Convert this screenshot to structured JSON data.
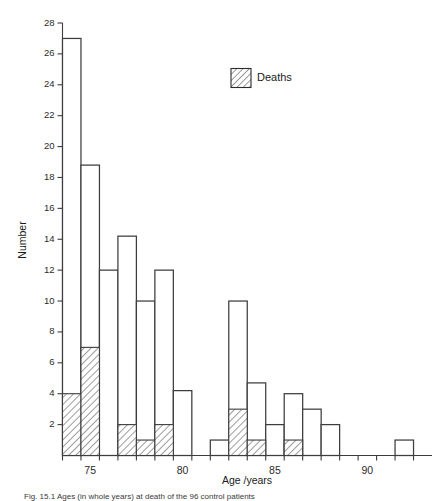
{
  "figure": {
    "caption": "Fig. 15.1  Ages (in whole years) at death of the 96 control patients",
    "legend": {
      "label": "Deaths",
      "swatch_name": "hatched-swatch"
    }
  },
  "chart_data": {
    "type": "bar",
    "title": "",
    "xlabel": "Age /years",
    "ylabel": "Number",
    "xlim": [
      73.5,
      93.5
    ],
    "ylim": [
      0,
      28
    ],
    "ytick_values": [
      2,
      4,
      6,
      8,
      10,
      12,
      14,
      16,
      18,
      20,
      22,
      24,
      26,
      28
    ],
    "xtick_values": [
      75,
      80,
      85,
      90
    ],
    "xtick_labels": [
      "75",
      "80",
      "85",
      "90"
    ],
    "bin_width": 1,
    "grid": false,
    "legend_position": "top-right",
    "series": [
      {
        "name": "Total",
        "style": "outline",
        "x": [
          74,
          75,
          76,
          77,
          78,
          79,
          80,
          81,
          82,
          83,
          84,
          85,
          86,
          87,
          88,
          89,
          90,
          91,
          92
        ],
        "values": [
          27,
          18.8,
          12,
          14.2,
          10,
          12,
          4.2,
          0,
          1,
          10,
          4.7,
          2,
          4,
          3,
          2,
          0,
          0,
          0,
          1
        ]
      },
      {
        "name": "Deaths",
        "style": "hatched",
        "x": [
          74,
          75,
          76,
          77,
          78,
          79,
          80,
          81,
          82,
          83,
          84,
          85,
          86,
          87,
          88,
          89,
          90,
          91,
          92
        ],
        "values": [
          4,
          7,
          0,
          2,
          1,
          2,
          0,
          0,
          0,
          3,
          1,
          0,
          1,
          0,
          0,
          0,
          0,
          0,
          0
        ]
      }
    ]
  },
  "colors": {
    "axis": "#3d3d3d",
    "bar_fill": "#ffffff",
    "bar_stroke": "#3d3d3d",
    "hatch": "#4a4a4a",
    "text": "#1a1a1a"
  }
}
